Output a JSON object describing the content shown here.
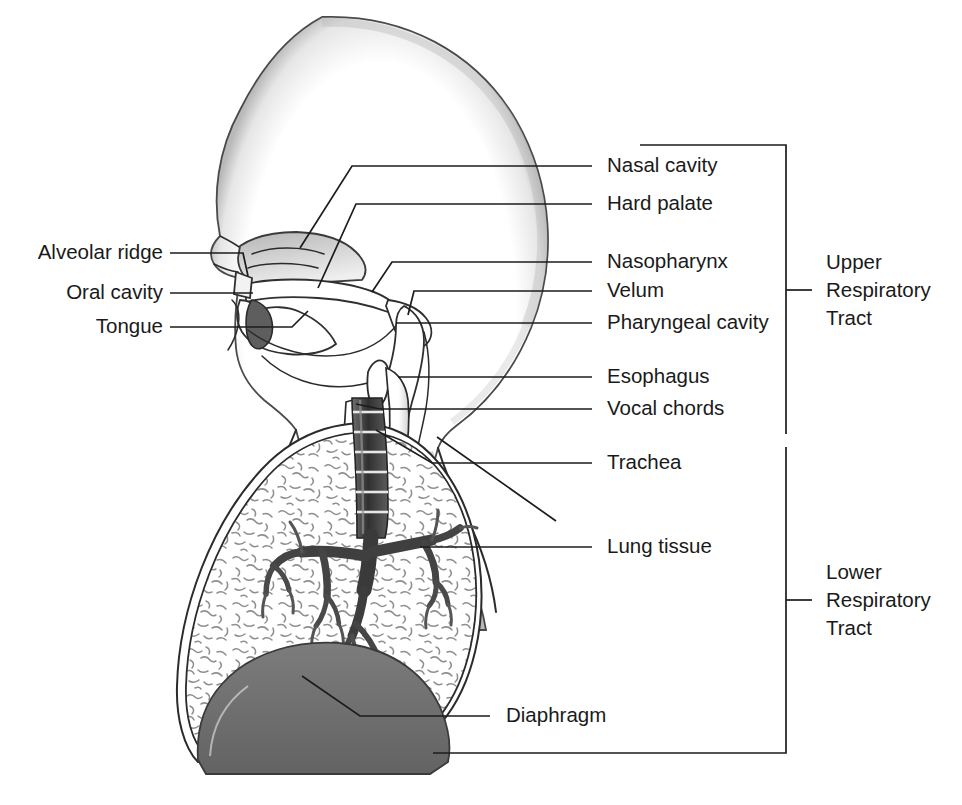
{
  "figure": {
    "background_color": "#ffffff",
    "line_color": "#1c1c1c",
    "text_color": "#1a1a1a"
  },
  "labels_left": [
    {
      "id": "alveolar-ridge",
      "text": "Alveolar ridge"
    },
    {
      "id": "oral-cavity",
      "text": "Oral cavity"
    },
    {
      "id": "tongue",
      "text": "Tongue"
    }
  ],
  "labels_right": [
    {
      "id": "nasal-cavity",
      "text": "Nasal cavity"
    },
    {
      "id": "hard-palate",
      "text": "Hard palate"
    },
    {
      "id": "nasopharynx",
      "text": "Nasopharynx"
    },
    {
      "id": "velum",
      "text": "Velum"
    },
    {
      "id": "pharyngeal-cavity",
      "text": "Pharyngeal cavity"
    },
    {
      "id": "esophagus",
      "text": "Esophagus"
    },
    {
      "id": "vocal-chords",
      "text": "Vocal chords"
    },
    {
      "id": "trachea",
      "text": "Trachea"
    },
    {
      "id": "lung-tissue",
      "text": "Lung tissue"
    },
    {
      "id": "diaphragm",
      "text": "Diaphragm"
    }
  ],
  "brackets": [
    {
      "id": "upper-respiratory-tract",
      "line1": "Upper",
      "line2": "Respiratory",
      "line3": "Tract"
    },
    {
      "id": "lower-respiratory-tract",
      "line1": "Lower",
      "line2": "Respiratory",
      "line3": "Tract"
    }
  ],
  "colors": {
    "outline": "#2b2b2b",
    "diaphragm": "#6f6f6f",
    "bronchi": "#4a4a4a",
    "trachea_ring": "#3a3a3a",
    "tissue_stipple": "#8a8a8a",
    "head_shade": "#c9c9c9"
  }
}
